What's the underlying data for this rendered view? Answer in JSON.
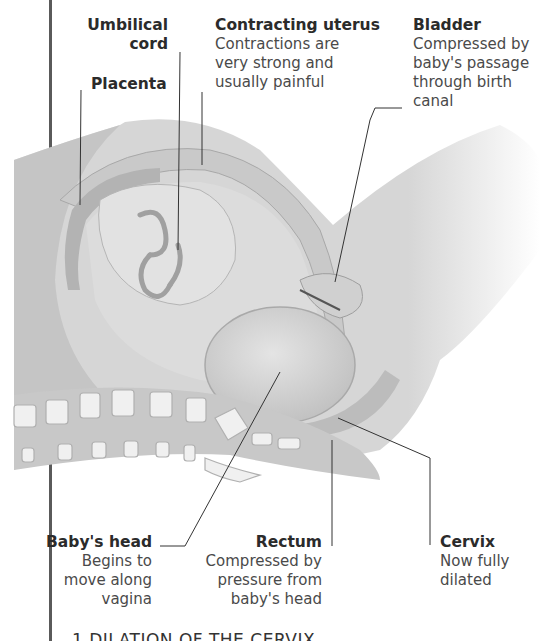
{
  "figure": {
    "colors": {
      "tissue_light": "#d9d9d9",
      "tissue_mid": "#c4c4c4",
      "tissue_dark": "#a9a9a9",
      "bone": "#f2f2f2",
      "leader_line": "#333333",
      "frame_rule": "#5a5a5a"
    }
  },
  "labels": {
    "umbilical_cord": {
      "title_line1": "Umbilical",
      "title_line2": "cord"
    },
    "placenta": {
      "title": "Placenta"
    },
    "contracting_uterus": {
      "title": "Contracting uterus",
      "desc_lines": [
        "Contractions are",
        "very strong and",
        "usually painful"
      ]
    },
    "bladder": {
      "title": "Bladder",
      "desc_lines": [
        "Compressed by",
        "baby's passage",
        "through birth",
        "canal"
      ]
    },
    "babys_head": {
      "title": "Baby's head",
      "desc_lines": [
        "Begins to",
        "move along",
        "vagina"
      ]
    },
    "rectum": {
      "title": "Rectum",
      "desc_lines": [
        "Compressed by",
        "pressure from",
        "baby's head"
      ]
    },
    "cervix": {
      "title": "Cervix",
      "desc_lines": [
        "Now fully",
        "dilated"
      ]
    }
  },
  "caption": {
    "text": "1 DILATION OF THE CERVIX"
  }
}
